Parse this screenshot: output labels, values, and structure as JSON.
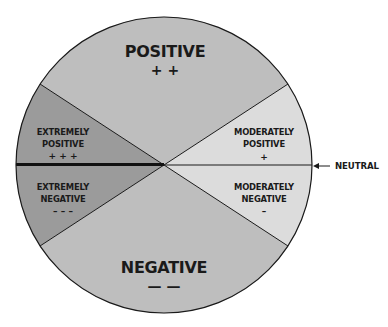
{
  "diagram": {
    "type": "attitude-scale-circle",
    "colors": {
      "extreme": "#9b9b9b",
      "standard": "#bebebe",
      "moderate": "#dcdcdc",
      "outline": "#1a1a1a"
    },
    "segments": {
      "positive": {
        "label": "POSITIVE",
        "symbol": "+ +"
      },
      "negative": {
        "label": "NEGATIVE",
        "symbol": "— —"
      },
      "extremely_positive": {
        "line1": "EXTREMELY",
        "line2": "POSITIVE",
        "symbol": "+ + +"
      },
      "extremely_negative": {
        "line1": "EXTREMELY",
        "line2": "NEGATIVE",
        "symbol": "– – –"
      },
      "moderately_positive": {
        "line1": "MODERATELY",
        "line2": "POSITIVE",
        "symbol": "+"
      },
      "moderately_negative": {
        "line1": "MODERATELY",
        "line2": "NEGATIVE",
        "symbol": "–"
      }
    },
    "neutral_label": "NEUTRAL"
  }
}
